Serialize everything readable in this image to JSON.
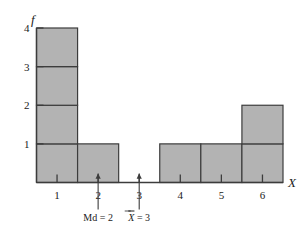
{
  "figure": {
    "name": "frequency-histogram",
    "background_color": "#ffffff"
  },
  "chart_data": {
    "type": "bar",
    "title": "",
    "subtitle": "",
    "xlabel": "X",
    "ylabel": "f",
    "categories": [
      "1",
      "2",
      "3",
      "4",
      "5",
      "6"
    ],
    "values": [
      4,
      1,
      0,
      1,
      1,
      2
    ],
    "x": [
      1,
      2,
      3,
      4,
      5,
      6
    ],
    "xlim": [
      0.5,
      6.5
    ],
    "ylim": [
      0,
      4
    ],
    "x_tick_labels": [
      "1",
      "2",
      "3",
      "4",
      "5",
      "6"
    ],
    "y_tick_labels": [
      "1",
      "2",
      "3",
      "4"
    ],
    "y_ticks": [
      1,
      2,
      3,
      4
    ],
    "grid": false,
    "legend": null,
    "legend_position": "none",
    "stacked_unit_cells": true,
    "bar_fill_color": "#b3b3b3",
    "bar_stroke_color": "#3c3c3c",
    "axis_color": "#3c3c3c",
    "annotations": [
      {
        "name": "median-marker",
        "text_prefix": "Md",
        "text_equals": "=",
        "text_value": "2",
        "label": "Md = 2",
        "x": 2,
        "kind": "up-arrow"
      },
      {
        "name": "mean-marker",
        "text_prefix": "X",
        "text_overbar": true,
        "text_equals": "=",
        "text_value": "3",
        "label": "X̅ = 3",
        "x": 3,
        "kind": "up-arrow"
      }
    ]
  }
}
